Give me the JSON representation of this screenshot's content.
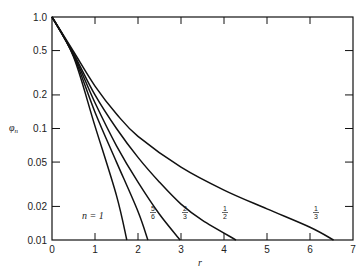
{
  "chart_data": {
    "type": "line",
    "title": "",
    "xlabel": "r",
    "ylabel": "φn",
    "xlim": [
      0,
      7
    ],
    "ylim": [
      0.01,
      1.0
    ],
    "yscale": "log",
    "grid": false,
    "x_ticks": [
      "0",
      "1",
      "2",
      "3",
      "4",
      "5",
      "6",
      "7"
    ],
    "y_ticks": [
      "1.0",
      "0.5",
      "0.2",
      "0.1",
      "0.05",
      "0.02",
      "0.01"
    ],
    "series": [
      {
        "name": "n = 1",
        "label_num": "",
        "label_den": "",
        "points": [
          [
            0,
            1
          ],
          [
            0.5,
            0.44
          ],
          [
            1.0,
            0.105
          ],
          [
            1.5,
            0.025
          ],
          [
            1.74,
            0.01
          ]
        ]
      },
      {
        "name": "5/6",
        "label_num": "5",
        "label_den": "6",
        "points": [
          [
            0,
            1
          ],
          [
            0.5,
            0.45
          ],
          [
            1.0,
            0.14
          ],
          [
            1.5,
            0.05
          ],
          [
            2.0,
            0.018
          ],
          [
            2.23,
            0.01
          ]
        ]
      },
      {
        "name": "2/3",
        "label_num": "2",
        "label_den": "3",
        "points": [
          [
            0,
            1
          ],
          [
            0.5,
            0.46
          ],
          [
            1.0,
            0.17
          ],
          [
            1.5,
            0.07
          ],
          [
            2.0,
            0.033
          ],
          [
            2.5,
            0.017
          ],
          [
            2.98,
            0.01
          ]
        ]
      },
      {
        "name": "1/2",
        "label_num": "1",
        "label_den": "2",
        "points": [
          [
            0,
            1
          ],
          [
            0.5,
            0.47
          ],
          [
            1.0,
            0.2
          ],
          [
            1.5,
            0.1
          ],
          [
            2.0,
            0.055
          ],
          [
            2.5,
            0.033
          ],
          [
            3.0,
            0.021
          ],
          [
            3.5,
            0.015
          ],
          [
            4.28,
            0.01
          ]
        ]
      },
      {
        "name": "1/3",
        "label_num": "1",
        "label_den": "3",
        "points": [
          [
            0,
            1
          ],
          [
            0.5,
            0.49
          ],
          [
            1.0,
            0.24
          ],
          [
            1.5,
            0.135
          ],
          [
            2.0,
            0.085
          ],
          [
            3.0,
            0.045
          ],
          [
            4.0,
            0.028
          ],
          [
            5.0,
            0.019
          ],
          [
            6.0,
            0.013
          ],
          [
            6.55,
            0.01
          ]
        ]
      }
    ],
    "annotations": [
      "n = 1",
      "5/6",
      "2/3",
      "1/2",
      "1/3"
    ]
  },
  "labels": {
    "n_equals": "n = 1",
    "phi": "φ",
    "phi_sub": "n",
    "r": "r"
  }
}
